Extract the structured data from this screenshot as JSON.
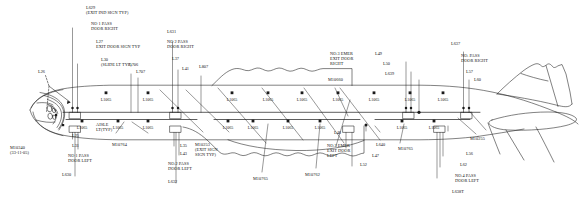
{
  "diagram": {
    "view": "side-elevation",
    "line_color": "#1a1a1a",
    "background": "#ffffff"
  },
  "top_callouts": [
    {
      "id": "L629",
      "lines": [
        "L629",
        "(EXIT IND SIGN TYP)"
      ],
      "x": 86,
      "y": 6
    },
    {
      "id": "no1-pass-door-right",
      "lines": [
        "NO 1 PASS",
        "DOOR RIGHT"
      ],
      "x": 91,
      "y": 22
    },
    {
      "id": "L27",
      "lines": [
        "L27",
        "EXIT DOOR SIGN TYP"
      ],
      "x": 96,
      "y": 40
    },
    {
      "id": "L30",
      "lines": [
        "L30",
        "(SLIDE LT TYP)"
      ],
      "x": 101,
      "y": 58
    },
    {
      "id": "L26",
      "lines": [
        "L26"
      ],
      "x": 38,
      "y": 70
    },
    {
      "id": "L631",
      "lines": [
        "L631"
      ],
      "x": 167,
      "y": 30
    },
    {
      "id": "no2-pass-door-right",
      "lines": [
        "NO 2 PASS",
        "DOOR RIGHT"
      ],
      "x": 167,
      "y": 40
    },
    {
      "id": "L37",
      "lines": [
        "L37"
      ],
      "x": 172,
      "y": 57
    },
    {
      "id": "L41",
      "lines": [
        "L41"
      ],
      "x": 182,
      "y": 67
    },
    {
      "id": "L807",
      "lines": [
        "L807"
      ],
      "x": 199,
      "y": 65
    },
    {
      "id": "L706",
      "lines": [
        "L706"
      ],
      "x": 129,
      "y": 63
    },
    {
      "id": "L707",
      "lines": [
        "L707"
      ],
      "x": 136,
      "y": 70
    },
    {
      "id": "no3-emer-exit-door-right",
      "lines": [
        "NO.3 EMER",
        "EXIT DOOR",
        "RIGHT"
      ],
      "x": 330,
      "y": 52
    },
    {
      "id": "M10660",
      "lines": [
        "M10660"
      ],
      "x": 328,
      "y": 78
    },
    {
      "id": "L49",
      "lines": [
        "L49"
      ],
      "x": 375,
      "y": 52
    },
    {
      "id": "L50",
      "lines": [
        "L50"
      ],
      "x": 383,
      "y": 62
    },
    {
      "id": "L639",
      "lines": [
        "L639"
      ],
      "x": 385,
      "y": 72
    },
    {
      "id": "L637",
      "lines": [
        "L637"
      ],
      "x": 451,
      "y": 42
    },
    {
      "id": "no-pass-door-right",
      "lines": [
        "NO. PASS",
        "DOOR RIGHT"
      ],
      "x": 461,
      "y": 54
    },
    {
      "id": "L57",
      "lines": [
        "L57"
      ],
      "x": 466,
      "y": 70
    },
    {
      "id": "L60",
      "lines": [
        "L60"
      ],
      "x": 474,
      "y": 78
    }
  ],
  "bottom_callouts": [
    {
      "id": "M10340",
      "lines": [
        "M10340",
        "(33-11-05)"
      ],
      "x": 10,
      "y": 146
    },
    {
      "id": "L25",
      "lines": [
        "L25"
      ],
      "x": 72,
      "y": 134
    },
    {
      "id": "L31",
      "lines": [
        "L31"
      ],
      "x": 72,
      "y": 144
    },
    {
      "id": "no1-pass-door-left",
      "lines": [
        "NO 1 PASS",
        "DOOR LEFT"
      ],
      "x": 68,
      "y": 154
    },
    {
      "id": "L630",
      "lines": [
        "L630"
      ],
      "x": 62,
      "y": 173
    },
    {
      "id": "aisle-lt-typ",
      "lines": [
        "AISLE",
        "LT(TYP)"
      ],
      "x": 96,
      "y": 123
    },
    {
      "id": "M10764",
      "lines": [
        "M10764"
      ],
      "x": 112,
      "y": 143
    },
    {
      "id": "L35",
      "lines": [
        "L35"
      ],
      "x": 180,
      "y": 144
    },
    {
      "id": "L43",
      "lines": [
        "L43"
      ],
      "x": 180,
      "y": 152
    },
    {
      "id": "no2-pass-door-left",
      "lines": [
        "NO.2 PASS",
        "DOOR LEFT"
      ],
      "x": 168,
      "y": 162
    },
    {
      "id": "L632",
      "lines": [
        "L632"
      ],
      "x": 168,
      "y": 180
    },
    {
      "id": "M10253",
      "lines": [
        "M10253",
        "(EXIT SIGN",
        "SIGN TYP)"
      ],
      "x": 195,
      "y": 143
    },
    {
      "id": "M10765-left",
      "lines": [
        "M10765"
      ],
      "x": 253,
      "y": 177
    },
    {
      "id": "M10762",
      "lines": [
        "M10762"
      ],
      "x": 305,
      "y": 173
    },
    {
      "id": "no3-emer-exit-door-left",
      "lines": [
        "NO.3 EMER",
        "EXIT DOOR",
        "LEFT"
      ],
      "x": 327,
      "y": 144
    },
    {
      "id": "L48",
      "lines": [
        "L48"
      ],
      "x": 334,
      "y": 131
    },
    {
      "id": "L52",
      "lines": [
        "L52"
      ],
      "x": 360,
      "y": 163
    },
    {
      "id": "L47",
      "lines": [
        "L47"
      ],
      "x": 372,
      "y": 154
    },
    {
      "id": "L640",
      "lines": [
        "L640"
      ],
      "x": 376,
      "y": 143
    },
    {
      "id": "M10765-right",
      "lines": [
        "M10765"
      ],
      "x": 398,
      "y": 147
    },
    {
      "id": "L56",
      "lines": [
        "L56"
      ],
      "x": 466,
      "y": 152
    },
    {
      "id": "L62",
      "lines": [
        "L62"
      ],
      "x": 460,
      "y": 163
    },
    {
      "id": "no4-pass-door-left",
      "lines": [
        "NO.4 PASS",
        "DOOR LEFT"
      ],
      "x": 455,
      "y": 174
    },
    {
      "id": "L638T",
      "lines": [
        "L638T"
      ],
      "x": 452,
      "y": 190
    },
    {
      "id": "M10255",
      "lines": [
        "M10255"
      ],
      "x": 470,
      "y": 137
    }
  ],
  "fixtures_upper": [
    {
      "label": "L1065",
      "x": 106,
      "y": 98
    },
    {
      "label": "L1065",
      "x": 148,
      "y": 98
    },
    {
      "label": "L1065",
      "x": 232,
      "y": 98
    },
    {
      "label": "L1065",
      "x": 268,
      "y": 98
    },
    {
      "label": "L1065",
      "x": 302,
      "y": 98
    },
    {
      "label": "L1065",
      "x": 338,
      "y": 98
    },
    {
      "label": "L1065",
      "x": 374,
      "y": 98
    },
    {
      "label": "L1065",
      "x": 410,
      "y": 98
    },
    {
      "label": "L1065",
      "x": 443,
      "y": 98
    }
  ],
  "fixtures_lower": [
    {
      "label": "L1065",
      "x": 82,
      "y": 126
    },
    {
      "label": "L1065",
      "x": 118,
      "y": 126
    },
    {
      "label": "L1065",
      "x": 148,
      "y": 126
    },
    {
      "label": "L1065",
      "x": 228,
      "y": 126
    },
    {
      "label": "L1065",
      "x": 253,
      "y": 126
    },
    {
      "label": "L1065",
      "x": 288,
      "y": 126
    },
    {
      "label": "L1065",
      "x": 320,
      "y": 126
    },
    {
      "label": "L1065",
      "x": 402,
      "y": 126
    },
    {
      "label": "L1065",
      "x": 434,
      "y": 126
    }
  ]
}
